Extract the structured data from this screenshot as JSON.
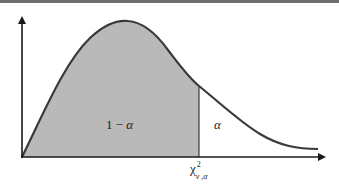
{
  "diagram": {
    "type": "chi-square distribution",
    "colors": {
      "curve": "#3a3a3a",
      "shaded_area": "#b9b9b9",
      "axes": "#1a1a1a",
      "top_border": "#6e6e6e",
      "background": "#ffffff"
    },
    "labels": {
      "left_area": {
        "prefix": "1 − ",
        "symbol": "α"
      },
      "right_tail": "α",
      "critical_value": {
        "base": "χ",
        "superscript": "2",
        "subscript": "ν ,α"
      }
    }
  }
}
